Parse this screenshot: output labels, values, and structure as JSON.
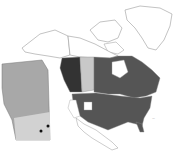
{
  "map": {
    "subject": "North America distribution map with Alberta inset",
    "colors": {
      "background": "#ffffff",
      "outline": "#9a9a9a",
      "present_region": "#555555",
      "dark_region": "#333333",
      "light_region": "#c8c8c8",
      "inset_fill": "#a8a8a8",
      "inset_light": "#d2d2d2",
      "record_marker": "#111111"
    },
    "regions": {
      "shaded": [
        "contiguous United States (most states)",
        "eastern/central Canadian provinces",
        "British Columbia (darker)"
      ],
      "light": [
        "Alberta"
      ],
      "unshaded": [
        "Northern territories",
        "Greenland",
        "Mexico",
        "western US states partially"
      ]
    },
    "inset": {
      "label": "Alberta",
      "markers": 2
    },
    "scale_label": "—"
  }
}
